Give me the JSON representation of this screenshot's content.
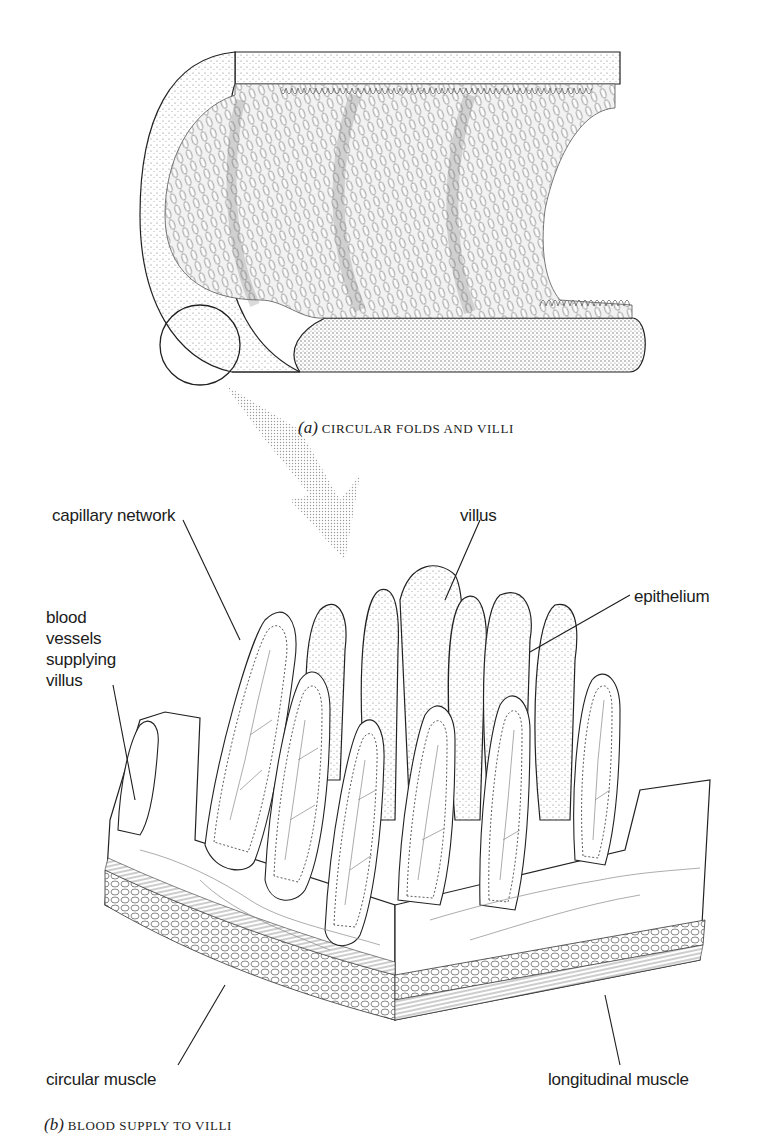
{
  "figure": {
    "panel_a": {
      "letter": "(a)",
      "caption": "CIRCULAR FOLDS AND VILLI"
    },
    "panel_b": {
      "letter": "(b)",
      "caption": "BLOOD SUPPLY TO VILLI"
    },
    "labels": {
      "capillary_network": "capillary network",
      "villus": "villus",
      "epithelium": "epithelium",
      "blood_vessels": [
        "blood",
        "vessels",
        "supplying",
        "villus"
      ],
      "circular_muscle": "circular muscle",
      "longitudinal_muscle": "longitudinal muscle"
    },
    "colors": {
      "ink": "#1c1c1c",
      "stipple": "#8a8a8a",
      "background": "#ffffff"
    }
  }
}
